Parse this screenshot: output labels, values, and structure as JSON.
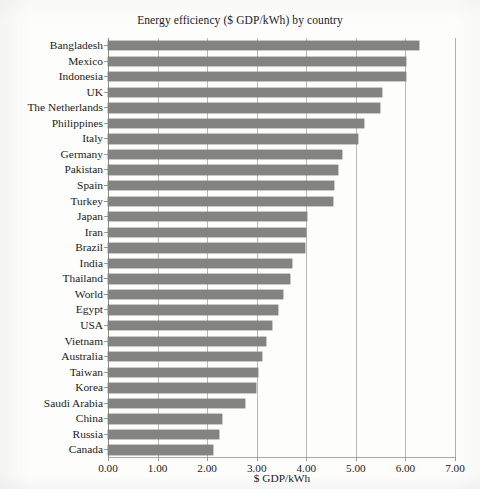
{
  "chart_data": {
    "type": "bar",
    "orientation": "horizontal",
    "title": "Energy efficiency ($ GDP/kWh) by country",
    "xlabel": "$ GDP/kWh",
    "ylabel": "",
    "xlim": [
      0.0,
      7.0
    ],
    "xticks": [
      "0.00",
      "1.00",
      "2.00",
      "3.00",
      "4.00",
      "5.00",
      "6.00",
      "7.00"
    ],
    "xtick_values": [
      0,
      1,
      2,
      3,
      4,
      5,
      6,
      7
    ],
    "grid": "vertical",
    "legend": "none",
    "bar_color": "#838382",
    "background_color": "#fdfdfc",
    "categories": [
      "Bangladesh",
      "Mexico",
      "Indonesia",
      "UK",
      "The Netherlands",
      "Philippines",
      "Italy",
      "Germany",
      "Pakistan",
      "Spain",
      "Turkey",
      "Japan",
      "Iran",
      "Brazil",
      "India",
      "Thailand",
      "World",
      "Egypt",
      "USA",
      "Vietnam",
      "Australia",
      "Taiwan",
      "Korea",
      "Saudi Arabia",
      "China",
      "Russia",
      "Canada"
    ],
    "values": [
      6.28,
      6.02,
      6.02,
      5.53,
      5.48,
      5.17,
      5.04,
      4.72,
      4.63,
      4.55,
      4.53,
      4.02,
      4.0,
      3.98,
      3.72,
      3.68,
      3.54,
      3.43,
      3.31,
      3.19,
      3.11,
      3.02,
      2.99,
      2.77,
      2.3,
      2.24,
      2.12
    ]
  }
}
